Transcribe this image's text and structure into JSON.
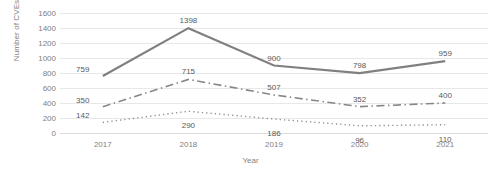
{
  "chart_data": {
    "type": "line",
    "title": "",
    "xlabel": "Year",
    "ylabel": "Number of CVEs",
    "categories": [
      "2017",
      "2018",
      "2019",
      "2020",
      "2021"
    ],
    "ylim": [
      0,
      1600
    ],
    "ytick_step": 200,
    "yticks": [
      1600,
      1400,
      1200,
      1000,
      800,
      600,
      400,
      200,
      0
    ],
    "ytick_labels": [
      "1600",
      "1400",
      "1200",
      "1000",
      "800",
      "600",
      "400",
      "200",
      "0"
    ],
    "grid": true,
    "legend": "none",
    "data_labels": true,
    "series": [
      {
        "name": "series-1",
        "line_style": "solid",
        "color": "#808080",
        "width": 2.2,
        "values": [
          759,
          1398,
          900,
          798,
          959
        ],
        "labels": [
          "759",
          "1398",
          "900",
          "798",
          "959"
        ]
      },
      {
        "name": "series-2",
        "line_style": "dash-dot",
        "color": "#868686",
        "width": 1.6,
        "values": [
          350,
          715,
          507,
          352,
          400
        ],
        "labels": [
          "350",
          "715",
          "507",
          "352",
          "400"
        ]
      },
      {
        "name": "series-3",
        "line_style": "dotted",
        "color": "#8f8f8f",
        "width": 1.4,
        "values": [
          142,
          290,
          186,
          96,
          110
        ],
        "labels": [
          "142",
          "290",
          "186",
          "96",
          "110"
        ]
      }
    ],
    "label_placement": {
      "series-1": [
        "left-above",
        "above",
        "above",
        "above",
        "above"
      ],
      "series-2": [
        "left-above",
        "above",
        "above",
        "above",
        "above"
      ],
      "series-3": [
        "left-above",
        "below",
        "below",
        "below",
        "below"
      ]
    }
  }
}
